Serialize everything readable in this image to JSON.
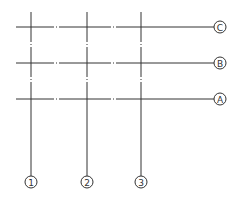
{
  "diagram": {
    "type": "structural-axis-grid",
    "colors": {
      "line": "#333333",
      "background": "#ffffff"
    },
    "horizontal_axes": [
      {
        "label": "C",
        "y": 27
      },
      {
        "label": "B",
        "y": 63
      },
      {
        "label": "A",
        "y": 99
      }
    ],
    "vertical_axes": [
      {
        "label": "1",
        "x": 31
      },
      {
        "label": "2",
        "x": 87
      },
      {
        "label": "3",
        "x": 141
      }
    ],
    "horizontal_extent": {
      "x_start": 16,
      "x_end": 214,
      "bubble_x": 220
    },
    "vertical_extent": {
      "y_start": 12,
      "y_end": 176,
      "bubble_y": 182
    },
    "bubble_radius": 6
  }
}
